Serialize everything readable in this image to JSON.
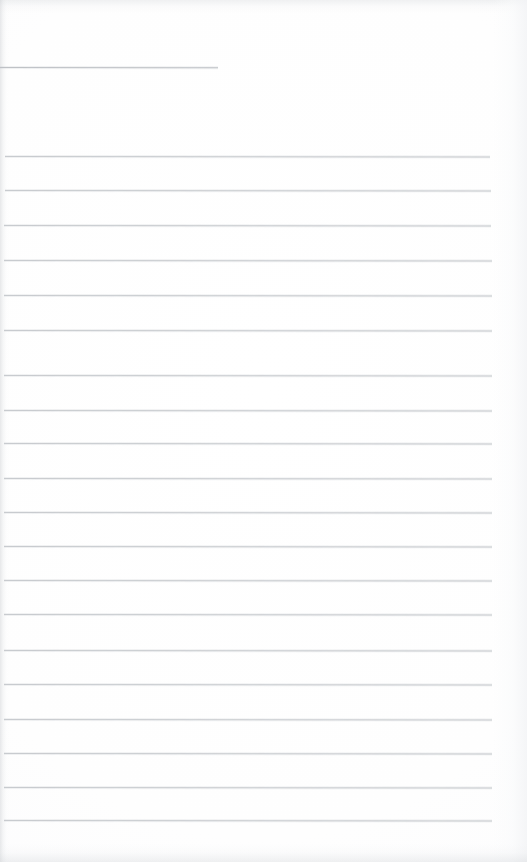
{
  "document": {
    "kind": "scanned-ruled-notepad-page",
    "title": "Blank Ruled Notepad Page",
    "description": "A scanned blank lined notepad page with faint grey horizontal rules and no handwriting or printed text.",
    "page_width": 527,
    "page_height": 862,
    "background_color": "#ffffff",
    "rule_color": "#c6c9cd",
    "short_rule_color": "#b9bcc1",
    "content_text": "",
    "visible_text_items": []
  },
  "short_rule": {
    "name": "top-short-rule",
    "y": 67,
    "x_start": 0,
    "x_end": 218,
    "thickness": 1
  },
  "rules": {
    "count": 20,
    "first_y": 156,
    "spacing": 34.9,
    "x_start": 5,
    "x_end": 492,
    "lines": [
      {
        "index": 1,
        "y": 156,
        "x_start": 5,
        "x_end": 490
      },
      {
        "index": 2,
        "y": 190,
        "x_start": 5,
        "x_end": 491
      },
      {
        "index": 3,
        "y": 225,
        "x_start": 4,
        "x_end": 491
      },
      {
        "index": 4,
        "y": 260,
        "x_start": 4,
        "x_end": 492
      },
      {
        "index": 5,
        "y": 295,
        "x_start": 4,
        "x_end": 492
      },
      {
        "index": 6,
        "y": 330,
        "x_start": 4,
        "x_end": 492
      },
      {
        "index": 7,
        "y": 375,
        "x_start": 4,
        "x_end": 492
      },
      {
        "index": 8,
        "y": 410,
        "x_start": 4,
        "x_end": 492
      },
      {
        "index": 9,
        "y": 443,
        "x_start": 4,
        "x_end": 492
      },
      {
        "index": 10,
        "y": 478,
        "x_start": 4,
        "x_end": 492
      },
      {
        "index": 11,
        "y": 512,
        "x_start": 4,
        "x_end": 492
      },
      {
        "index": 12,
        "y": 546,
        "x_start": 4,
        "x_end": 492
      },
      {
        "index": 13,
        "y": 580,
        "x_start": 4,
        "x_end": 492
      },
      {
        "index": 14,
        "y": 614,
        "x_start": 4,
        "x_end": 492
      },
      {
        "index": 15,
        "y": 650,
        "x_start": 4,
        "x_end": 492
      },
      {
        "index": 16,
        "y": 684,
        "x_start": 4,
        "x_end": 492
      },
      {
        "index": 17,
        "y": 719,
        "x_start": 4,
        "x_end": 492
      },
      {
        "index": 18,
        "y": 753,
        "x_start": 4,
        "x_end": 492
      },
      {
        "index": 19,
        "y": 787,
        "x_start": 4,
        "x_end": 492
      },
      {
        "index": 20,
        "y": 820,
        "x_start": 4,
        "x_end": 492
      }
    ]
  },
  "scan_artifacts": {
    "left_edge_shadow": true,
    "right_edge_shadow": true,
    "top_smudge_band": true,
    "bottom_noise_band": true
  }
}
